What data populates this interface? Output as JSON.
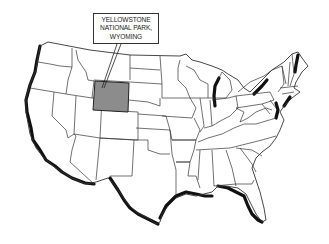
{
  "map": {
    "title": "United States map",
    "highlighted_state": "Wyoming",
    "highlight_color": "#8c8c8c",
    "border_color": "#333333",
    "coast_shadow_color": "#111111",
    "background": "#ffffff"
  },
  "callout": {
    "line1": "YELLOWSTONE",
    "line2": "NATIONAL PARK,",
    "line3": "WYOMING"
  }
}
